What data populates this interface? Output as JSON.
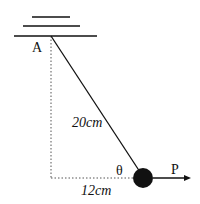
{
  "diagram": {
    "type": "pendulum-force-diagram",
    "pivot_label": "A",
    "string_length_label": "20cm",
    "horizontal_distance_label": "12cm",
    "angle_label": "θ",
    "force_label": "P",
    "colors": {
      "line": "#111111",
      "bob": "#111111",
      "dashed": "#555555"
    }
  }
}
